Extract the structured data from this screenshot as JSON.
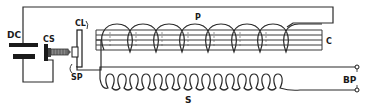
{
  "diagram": {
    "type": "induction coil circuit schematic",
    "components": [
      {
        "id": "DC",
        "label": "DC",
        "description": "battery (direct current source)"
      },
      {
        "id": "CS",
        "label": "CS",
        "description": "contact screw"
      },
      {
        "id": "CL",
        "label": "CL",
        "description": "contact lever / interrupter armature"
      },
      {
        "id": "SP",
        "label": "SP",
        "description": "spring"
      },
      {
        "id": "P",
        "label": "P",
        "description": "primary coil"
      },
      {
        "id": "C",
        "label": "C",
        "description": "iron core"
      },
      {
        "id": "S",
        "label": "S",
        "description": "secondary coil"
      },
      {
        "id": "BP",
        "label": "BP",
        "description": "binding posts (secondary terminals)"
      }
    ],
    "labels": {
      "dc": "DC",
      "cs": "CS",
      "cl": "CL",
      "sp": "SP",
      "p": "P",
      "c": "C",
      "s": "S",
      "bp": "BP"
    },
    "primary_turns": 8,
    "secondary_turns": 15,
    "colors": {
      "ink": "#1a1a1a",
      "background": "#ffffff"
    }
  }
}
